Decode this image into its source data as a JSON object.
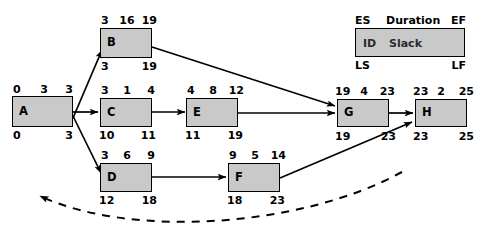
{
  "diagram": {
    "node_fill": "#c9c9c9",
    "node_stroke": "#000000",
    "nodes": [
      {
        "id": "A",
        "es": "0",
        "duration": "3",
        "ef": "3",
        "ls": "0",
        "lf": "3"
      },
      {
        "id": "B",
        "es": "3",
        "duration": "16",
        "ef": "19",
        "ls": "3",
        "lf": "19"
      },
      {
        "id": "C",
        "es": "3",
        "duration": "1",
        "ef": "4",
        "ls": "10",
        "lf": "11"
      },
      {
        "id": "D",
        "es": "3",
        "duration": "6",
        "ef": "9",
        "ls": "12",
        "lf": "18"
      },
      {
        "id": "E",
        "es": "4",
        "duration": "8",
        "ef": "12",
        "ls": "11",
        "lf": "19"
      },
      {
        "id": "F",
        "es": "9",
        "duration": "5",
        "ef": "14",
        "ls": "18",
        "lf": "23"
      },
      {
        "id": "G",
        "es": "19",
        "duration": "4",
        "ef": "23",
        "ls": "19",
        "lf": "23"
      },
      {
        "id": "H",
        "es": "23",
        "duration": "2",
        "ef": "25",
        "ls": "23",
        "lf": "25"
      }
    ],
    "edges": [
      {
        "from": "A",
        "to": "B"
      },
      {
        "from": "A",
        "to": "C"
      },
      {
        "from": "A",
        "to": "D"
      },
      {
        "from": "B",
        "to": "G"
      },
      {
        "from": "C",
        "to": "E"
      },
      {
        "from": "D",
        "to": "F"
      },
      {
        "from": "E",
        "to": "G"
      },
      {
        "from": "F",
        "to": "H"
      },
      {
        "from": "G",
        "to": "H"
      }
    ],
    "feedback_arrow": {
      "style": "dashed",
      "direction": "right-to-left"
    }
  },
  "legend": {
    "es_label": "ES",
    "duration_label": "Duration",
    "ef_label": "EF",
    "id_label": "ID",
    "slack_label": "Slack",
    "ls_label": "LS",
    "lf_label": "LF"
  }
}
